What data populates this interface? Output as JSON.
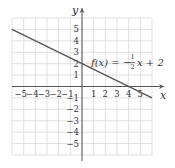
{
  "chart_data": {
    "type": "line",
    "title": "",
    "xlabel": "x",
    "ylabel": "y",
    "xlim": [
      -6,
      6
    ],
    "ylim": [
      -6,
      6
    ],
    "grid": true,
    "x_ticks": [
      -5,
      -4,
      -3,
      -2,
      -1,
      1,
      2,
      3,
      4,
      5
    ],
    "y_ticks": [
      -5,
      -4,
      -3,
      -2,
      -1,
      1,
      2,
      3,
      4,
      5
    ],
    "x_tick_labels": [
      "−5",
      "−4",
      "−3",
      "−2",
      "−1",
      "1",
      "2",
      "3",
      "4",
      "5"
    ],
    "y_tick_labels": [
      "−5",
      "−4",
      "−3",
      "−2",
      "−1",
      "1",
      "2",
      "3",
      "4",
      "5"
    ],
    "series": [
      {
        "name": "f(x) = −½x + 2",
        "slope": -0.5,
        "intercept": 2,
        "x": [
          -6,
          6
        ],
        "y": [
          5,
          -1
        ]
      }
    ],
    "annotations": [
      {
        "text_parts": [
          "f(x) = −",
          "1",
          "2",
          "x + 2"
        ],
        "x": 1,
        "y": 2.6
      }
    ],
    "colors": {
      "grid": "#d9d9d9",
      "axis": "#555555",
      "line": "#555555"
    }
  },
  "labels": {
    "x_axis": "x",
    "y_axis": "y",
    "func_prefix": "f(x) = −",
    "func_num": "1",
    "func_den": "2",
    "func_suffix": "x + 2"
  }
}
